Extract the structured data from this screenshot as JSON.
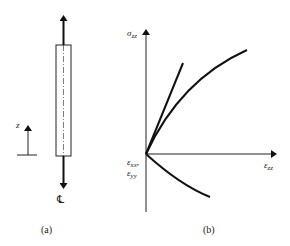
{
  "panel_a": {
    "caption": "(a)",
    "z_axis_label": "z",
    "centerline_label": "℄",
    "description": "Cylindrical specimen with axial tensile load arrows and centerline"
  },
  "panel_b": {
    "caption": "(b)",
    "y_axis_label": "σ",
    "y_axis_sub": "zz",
    "x_axis_label": "ε",
    "x_axis_sub": "zz",
    "origin_label_1": "ε",
    "origin_label_1_sub": "xx",
    "origin_label_2": "ε",
    "origin_label_2_sub": "yy",
    "curves": [
      {
        "name": "initial-tangent-line",
        "type": "line"
      },
      {
        "name": "stress-strain-curve-axial",
        "type": "concave-down"
      },
      {
        "name": "lateral-strain-curve",
        "type": "concave-up-negative"
      }
    ]
  }
}
